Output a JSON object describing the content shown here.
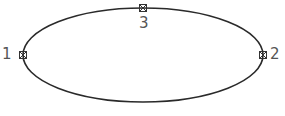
{
  "diagram": {
    "shape": "ellipse",
    "stroke_color": "#2a2a2a",
    "points": [
      {
        "id": "1",
        "label": "1",
        "position": "left"
      },
      {
        "id": "2",
        "label": "2",
        "position": "right"
      },
      {
        "id": "3",
        "label": "3",
        "position": "top"
      }
    ]
  }
}
